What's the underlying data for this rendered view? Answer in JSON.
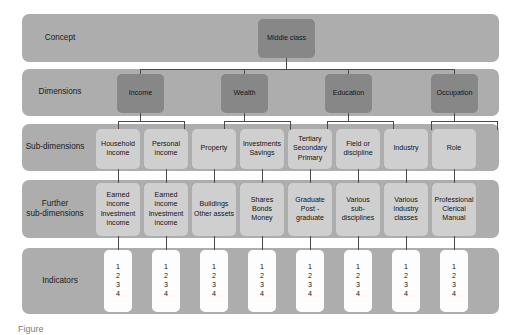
{
  "figure": {
    "type": "hierarchical-concept-tree",
    "caption": "Figure",
    "colors": {
      "band": "#adadad",
      "node_dark": "#878787",
      "node_light": "#cfcfcf",
      "node_white": "#fdfdfd",
      "connector": "#4a4a4a",
      "text": "#141414",
      "background": "#ffffff"
    }
  },
  "rows": [
    {
      "id": "concept",
      "label": "Concept"
    },
    {
      "id": "dimensions",
      "label": "Dimensions"
    },
    {
      "id": "subdim",
      "label": "Sub-dimensions"
    },
    {
      "id": "furthersub",
      "label": "Further\nsub-dimensions"
    },
    {
      "id": "indicators",
      "label": "Indicators"
    }
  ],
  "concept": {
    "node": {
      "label": "Middle class"
    }
  },
  "dimensions": [
    {
      "label": "Income"
    },
    {
      "label": "Wealth"
    },
    {
      "label": "Education"
    },
    {
      "label": "Occupation"
    }
  ],
  "sub_dimensions": [
    {
      "lines": [
        "Household",
        "income"
      ]
    },
    {
      "lines": [
        "Personal",
        "income"
      ]
    },
    {
      "lines": [
        "Property"
      ]
    },
    {
      "lines": [
        "Investments",
        "Savings"
      ]
    },
    {
      "lines": [
        "Tertiary",
        "Secondary",
        "Primary"
      ]
    },
    {
      "lines": [
        "Field or",
        "discipline"
      ]
    },
    {
      "lines": [
        "Industry"
      ]
    },
    {
      "lines": [
        "Role"
      ]
    }
  ],
  "further_sub_dimensions": [
    {
      "lines": [
        "Earned",
        "income",
        "Investment",
        "income"
      ]
    },
    {
      "lines": [
        "Earned",
        "income",
        "Investment",
        "income"
      ]
    },
    {
      "lines": [
        "Buildings",
        "Other assets"
      ]
    },
    {
      "lines": [
        "Shares",
        "Bonds",
        "Money"
      ]
    },
    {
      "lines": [
        "Graduate",
        "Post -",
        "graduate"
      ]
    },
    {
      "lines": [
        "Various",
        "sub-",
        "disciplines"
      ]
    },
    {
      "lines": [
        "Various",
        "industry",
        "classes"
      ]
    },
    {
      "lines": [
        "Professional",
        "Clerical",
        "Manual"
      ]
    }
  ],
  "indicators": [
    {
      "lines": [
        "1",
        "2",
        "3",
        "4"
      ]
    },
    {
      "lines": [
        "1",
        "2",
        "3",
        "4"
      ]
    },
    {
      "lines": [
        "1",
        "2",
        "3",
        "4"
      ]
    },
    {
      "lines": [
        "1",
        "2",
        "3",
        "4"
      ]
    },
    {
      "lines": [
        "1",
        "2",
        "3",
        "4"
      ]
    },
    {
      "lines": [
        "1",
        "2",
        "3",
        "4"
      ]
    },
    {
      "lines": [
        "1",
        "2",
        "3",
        "4"
      ]
    },
    {
      "lines": [
        "1",
        "2",
        "3",
        "4"
      ]
    }
  ]
}
